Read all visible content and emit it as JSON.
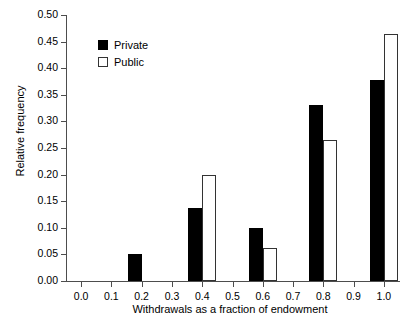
{
  "chart_data": {
    "type": "bar",
    "title": "",
    "xlabel": "Withdrawals as a fraction of endowment",
    "ylabel": "Relative frequency",
    "categories": [
      "0.2",
      "0.4",
      "0.6",
      "0.8",
      "1.0"
    ],
    "series": [
      {
        "name": "Private",
        "color": "#000000",
        "values": [
          0.05,
          0.1375,
          0.1,
          0.33,
          0.378
        ]
      },
      {
        "name": "Public",
        "color": "#ffffff",
        "values": [
          0.0,
          0.2,
          0.0625,
          0.265,
          0.465
        ]
      }
    ],
    "xlim": [
      -0.05,
      1.05
    ],
    "ylim": [
      0.0,
      0.5
    ],
    "xticks": [
      "0.0",
      "0.1",
      "0.2",
      "0.3",
      "0.4",
      "0.5",
      "0.6",
      "0.7",
      "0.8",
      "0.9",
      "1.0"
    ],
    "xtick_values": [
      0.0,
      0.1,
      0.2,
      0.3,
      0.4,
      0.5,
      0.6,
      0.7,
      0.8,
      0.9,
      1.0
    ],
    "yticks": [
      "0.00",
      "0.05",
      "0.10",
      "0.15",
      "0.20",
      "0.25",
      "0.30",
      "0.35",
      "0.40",
      "0.45",
      "0.50"
    ],
    "ytick_values": [
      0.0,
      0.05,
      0.1,
      0.15,
      0.2,
      0.25,
      0.3,
      0.35,
      0.4,
      0.45,
      0.5
    ],
    "grid": false,
    "legend_position": "upper-left-inside",
    "legend": [
      "Private",
      "Public"
    ]
  }
}
